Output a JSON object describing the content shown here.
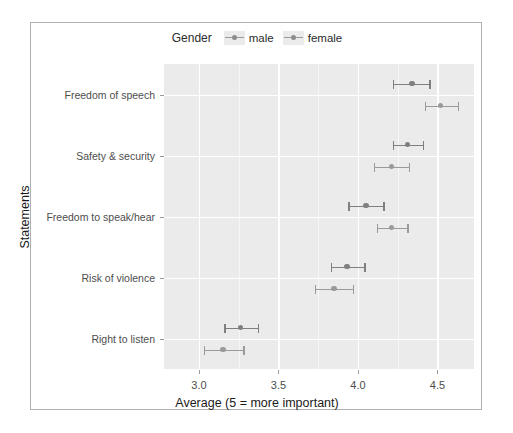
{
  "chart_data": {
    "type": "scatter",
    "title": "",
    "xlabel": "Average (5 = more important)",
    "ylabel": "Statements",
    "xlim": [
      2.78,
      4.73
    ],
    "xticks": [
      3.0,
      3.5,
      4.0,
      4.5
    ],
    "xtick_labels": [
      "3.0",
      "3.5",
      "4.0",
      "4.5"
    ],
    "x_minor_ticks": [
      3.25,
      3.75,
      4.25
    ],
    "categories": [
      "Freedom of speech",
      "Safety & security",
      "Freedom to speak/hear",
      "Risk of violence",
      "Right to listen"
    ],
    "grid": true,
    "legend_position": "top",
    "series": [
      {
        "name": "male",
        "color": "#7f7f7f",
        "values": [
          4.34,
          4.31,
          4.05,
          3.93,
          3.26
        ],
        "ci_low": [
          4.22,
          4.22,
          3.94,
          3.83,
          3.16
        ],
        "ci_high": [
          4.45,
          4.41,
          4.16,
          4.04,
          3.37
        ]
      },
      {
        "name": "female",
        "color": "#9a9a9a",
        "values": [
          4.52,
          4.21,
          4.21,
          3.85,
          3.15
        ],
        "ci_low": [
          4.42,
          4.1,
          4.12,
          3.73,
          3.03
        ],
        "ci_high": [
          4.63,
          4.32,
          4.31,
          3.97,
          3.28
        ]
      }
    ]
  },
  "legend": {
    "title": "Gender",
    "items": [
      {
        "label": "male"
      },
      {
        "label": "female"
      }
    ]
  },
  "axes": {
    "x_title": "Average (5 = more important)",
    "y_title": "Statements"
  }
}
